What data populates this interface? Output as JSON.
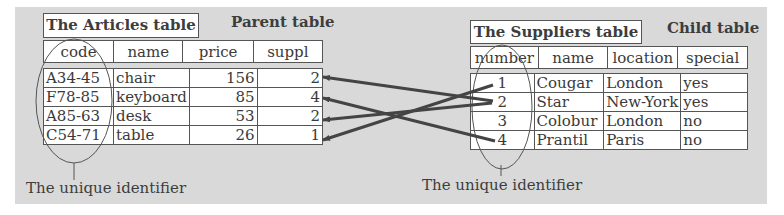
{
  "articles": {
    "title": "The Articles table",
    "role": "Parent table",
    "columns": [
      "code",
      "name",
      "price",
      "suppl"
    ],
    "rows": [
      {
        "code": "A34-45",
        "name": "chair",
        "price": "156",
        "suppl": "2"
      },
      {
        "code": "F78-85",
        "name": "keyboard",
        "price": "85",
        "suppl": "4"
      },
      {
        "code": "A85-63",
        "name": "desk",
        "price": "53",
        "suppl": "2"
      },
      {
        "code": "C54-71",
        "name": "table",
        "price": "26",
        "suppl": "1"
      }
    ],
    "identifier_caption": "The unique identifier"
  },
  "suppliers": {
    "title": "The Suppliers table",
    "role": "Child table",
    "columns": [
      "number",
      "name",
      "location",
      "special"
    ],
    "rows": [
      {
        "number": "1",
        "name": "Cougar",
        "location": "London",
        "special": "yes"
      },
      {
        "number": "2",
        "name": "Star",
        "location": "New-York",
        "special": "yes"
      },
      {
        "number": "3",
        "name": "Colobur",
        "location": "London",
        "special": "no"
      },
      {
        "number": "4",
        "name": "Prantil",
        "location": "Paris",
        "special": "no"
      }
    ],
    "identifier_caption": "The unique identifier"
  },
  "links": [
    {
      "from_supplier": "2",
      "to_article_row": 1
    },
    {
      "from_supplier": "4",
      "to_article_row": 2
    },
    {
      "from_supplier": "2",
      "to_article_row": 3
    },
    {
      "from_supplier": "1",
      "to_article_row": 4
    }
  ],
  "colors": {
    "panel": "#d9d9d9",
    "arrow": "#444444",
    "border": "#555555"
  }
}
